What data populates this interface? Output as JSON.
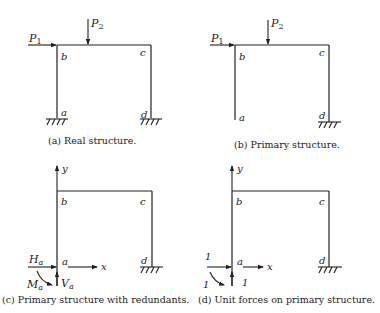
{
  "panels": [
    {
      "id": "a",
      "caption": "(a) Real structure.",
      "nodes": {
        "a": "a",
        "b": "b",
        "c": "c",
        "d": "d"
      },
      "loads": {
        "P1": "P",
        "P1_sub": "1",
        "P2": "P",
        "P2_sub": "2"
      },
      "supports": [
        "fixed-a",
        "fixed-d"
      ]
    },
    {
      "id": "b",
      "caption": "(b) Primary structure.",
      "nodes": {
        "a": "a",
        "b": "b",
        "c": "c",
        "d": "d"
      },
      "loads": {
        "P1": "P",
        "P1_sub": "1",
        "P2": "P",
        "P2_sub": "2"
      },
      "supports": [
        "free-a",
        "fixed-d"
      ]
    },
    {
      "id": "c",
      "caption": "(c) Primary structure with redundants.",
      "nodes": {
        "a": "a",
        "b": "b",
        "c": "c",
        "d": "d"
      },
      "axes": {
        "x": "x",
        "y": "y"
      },
      "redundants": {
        "H": "H",
        "H_sub": "a",
        "V": "V",
        "V_sub": "a",
        "M": "M",
        "M_sub": "a"
      },
      "supports": [
        "free-a",
        "fixed-d"
      ]
    },
    {
      "id": "d",
      "caption": "(d) Unit forces on primary structure.",
      "nodes": {
        "a": "a",
        "b": "b",
        "c": "c",
        "d": "d"
      },
      "axes": {
        "x": "x",
        "y": "y"
      },
      "unit_forces": {
        "H": "1",
        "V": "1",
        "M": "1"
      },
      "supports": [
        "free-a",
        "fixed-d"
      ]
    }
  ]
}
